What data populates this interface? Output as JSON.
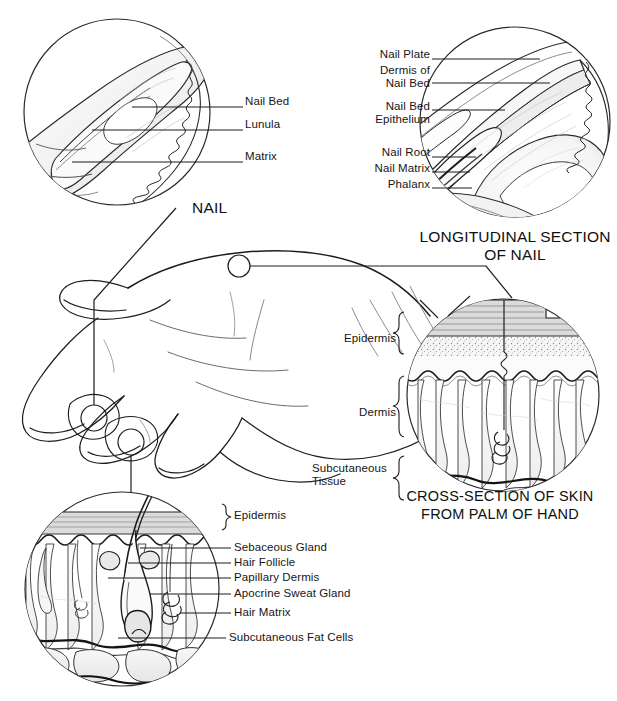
{
  "figure": {
    "domain_title": "Anatomy of the nail and skin",
    "background_color": "#ffffff",
    "ink_color": "#161616"
  },
  "panels": {
    "nail_surface": {
      "title": "NAIL",
      "title_pos": {
        "x": 192,
        "y": 200
      },
      "circle": {
        "cx": 117,
        "cy": 112,
        "r": 94
      },
      "labels": [
        {
          "text": "Nail Bed",
          "x": 247,
          "y": 101,
          "leader": {
            "x1": 130,
            "y1": 107,
            "x2": 243,
            "y2": 107
          }
        },
        {
          "text": "Lunula",
          "x": 247,
          "y": 123,
          "leader": {
            "x1": 90,
            "y1": 129,
            "x2": 243,
            "y2": 129
          }
        },
        {
          "text": "Matrix",
          "x": 247,
          "y": 155,
          "leader": {
            "x1": 70,
            "y1": 161,
            "x2": 243,
            "y2": 161
          }
        }
      ]
    },
    "nail_longitudinal": {
      "title_line1": "LONGITUDINAL SECTION",
      "title_line2": "OF NAIL",
      "title_pos": {
        "x": 513,
        "y": 236
      },
      "circle": {
        "cx": 515,
        "cy": 122,
        "r": 96
      },
      "labels": [
        {
          "text": "Nail Plate",
          "x": 428,
          "y": 53,
          "leader": {
            "x1": 432,
            "y1": 59,
            "x2": 538,
            "y2": 59
          }
        },
        {
          "text": "Dermis of",
          "x": 428,
          "y": 69,
          "leader": null
        },
        {
          "text": "Nail Bed",
          "x": 428,
          "y": 83,
          "leader": {
            "x1": 432,
            "y1": 83,
            "x2": 548,
            "y2": 83
          }
        },
        {
          "text": "Nail Bed",
          "x": 428,
          "y": 105,
          "leader": {
            "x1": 432,
            "y1": 110,
            "x2": 503,
            "y2": 110
          }
        },
        {
          "text": "Epithelium",
          "x": 428,
          "y": 119,
          "leader": null
        },
        {
          "text": "Nail Root",
          "x": 428,
          "y": 151,
          "leader": {
            "x1": 432,
            "y1": 157,
            "x2": 474,
            "y2": 157
          }
        },
        {
          "text": "Nail Matrix",
          "x": 428,
          "y": 167,
          "leader": {
            "x1": 432,
            "y1": 172,
            "x2": 468,
            "y2": 172
          }
        },
        {
          "text": "Phalanx",
          "x": 428,
          "y": 183,
          "leader": {
            "x1": 432,
            "y1": 188,
            "x2": 470,
            "y2": 188
          }
        }
      ]
    },
    "skin_palm": {
      "title_line1": "CROSS-SECTION OF SKIN",
      "title_line2": "FROM PALM OF HAND",
      "title_pos": {
        "x": 500,
        "y": 494
      },
      "circle": {
        "cx": 503,
        "cy": 395,
        "r": 97
      },
      "brackets": [
        {
          "label": "Epidermis",
          "x": 395,
          "y": 338,
          "y1": 314,
          "y2": 372,
          "bx": 400
        },
        {
          "label": "Dermis",
          "x": 395,
          "y": 412,
          "y1": 378,
          "y2": 452,
          "bx": 400
        },
        {
          "label": "Subcutaneous\nTissue",
          "x": 395,
          "y": 468,
          "y1": 456,
          "y2": 492,
          "bx": 400
        }
      ]
    },
    "skin_hair": {
      "circle": {
        "cx": 122,
        "cy": 589,
        "r": 98
      },
      "labels": [
        {
          "text": "Epidermis",
          "x": 227,
          "y": 516,
          "bracket": {
            "x": 219,
            "y1": 504,
            "y2": 526
          }
        },
        {
          "text": "Sebaceous Gland",
          "x": 235,
          "y": 542,
          "leader": {
            "x1": 140,
            "y1": 548,
            "x2": 231,
            "y2": 548
          }
        },
        {
          "text": "Hair Follicle",
          "x": 235,
          "y": 557,
          "leader": {
            "x1": 128,
            "y1": 563,
            "x2": 231,
            "y2": 563
          }
        },
        {
          "text": "Papillary Dermis",
          "x": 235,
          "y": 572,
          "leader": {
            "x1": 108,
            "y1": 578,
            "x2": 231,
            "y2": 578
          }
        },
        {
          "text": "Apocrine Sweat Gland",
          "x": 235,
          "y": 588,
          "leader": {
            "x1": 150,
            "y1": 594,
            "x2": 231,
            "y2": 594
          }
        },
        {
          "text": "Hair Matrix",
          "x": 235,
          "y": 607,
          "leader": {
            "x1": 180,
            "y1": 613,
            "x2": 231,
            "y2": 613
          }
        },
        {
          "text": "Subcutaneous Fat Cells",
          "x": 230,
          "y": 632,
          "leader": {
            "x1": 118,
            "y1": 638,
            "x2": 226,
            "y2": 638
          }
        }
      ]
    },
    "hand": {
      "callout_circles": [
        {
          "name": "palm-callout",
          "cx": 239,
          "cy": 266,
          "r": 11
        },
        {
          "name": "fingertip-callout-nail",
          "cx": 94,
          "cy": 418,
          "r": 13
        },
        {
          "name": "fingertip-callout-hair",
          "cx": 131,
          "cy": 442,
          "r": 13
        }
      ]
    }
  }
}
